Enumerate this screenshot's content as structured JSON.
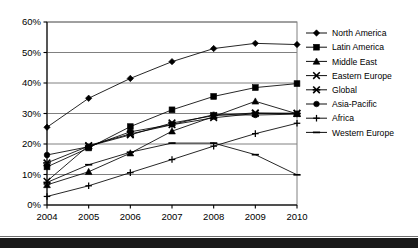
{
  "chart_data": {
    "type": "line",
    "title": "",
    "subtitle": "",
    "xlabel": "",
    "ylabel": "",
    "categories": [
      "2004",
      "2005",
      "2006",
      "2007",
      "2008",
      "2009",
      "2010"
    ],
    "x": [
      2004,
      2005,
      2006,
      2007,
      2008,
      2009,
      2010
    ],
    "ylim": [
      0,
      60
    ],
    "ytick_values": [
      0,
      10,
      20,
      30,
      40,
      50,
      60
    ],
    "ytick_labels": [
      "0%",
      "10%",
      "20%",
      "30%",
      "40%",
      "50%",
      "60%"
    ],
    "xtick_labels": [
      "2004",
      "2005",
      "2006",
      "2007",
      "2008",
      "2009",
      "2010"
    ],
    "grid": "horizontal",
    "legend_position": "right",
    "value_suffix": "%",
    "series": [
      {
        "name": "North America",
        "marker": "diamond",
        "values": [
          25.5,
          35.0,
          41.5,
          47.0,
          51.3,
          53.0,
          52.6
        ]
      },
      {
        "name": "Latin America",
        "marker": "square",
        "values": [
          12.5,
          18.7,
          25.7,
          31.2,
          35.6,
          38.5,
          39.8
        ]
      },
      {
        "name": "Middle East",
        "marker": "triangle",
        "values": [
          6.6,
          10.9,
          17.0,
          24.2,
          29.0,
          34.0,
          29.9
        ]
      },
      {
        "name": "Eastern Europe",
        "marker": "x",
        "values": [
          7.8,
          19.5,
          23.3,
          26.3,
          28.6,
          30.0,
          30.1
        ]
      },
      {
        "name": "Global",
        "marker": "star-x",
        "values": [
          13.8,
          19.3,
          23.0,
          26.9,
          29.3,
          30.2,
          30.0
        ]
      },
      {
        "name": "Asia-Pacific",
        "marker": "circle",
        "values": [
          16.4,
          19.1,
          24.0,
          26.4,
          29.6,
          29.5,
          29.8
        ]
      },
      {
        "name": "Africa",
        "marker": "plus",
        "values": [
          2.8,
          6.3,
          10.6,
          14.9,
          19.3,
          23.4,
          26.8
        ]
      },
      {
        "name": "Western Europe",
        "marker": "dash",
        "values": [
          7.4,
          13.2,
          17.3,
          20.3,
          20.3,
          16.5,
          9.9
        ]
      }
    ]
  },
  "legend": {
    "items": [
      {
        "label": "North America"
      },
      {
        "label": "Latin America"
      },
      {
        "label": "Middle East"
      },
      {
        "label": "Eastern Europe"
      },
      {
        "label": "Global"
      },
      {
        "label": "Asia-Pacific"
      },
      {
        "label": "Africa"
      },
      {
        "label": "Western Europe"
      }
    ]
  },
  "colors": {
    "series_line": "#000000",
    "grid": "#808080",
    "axis": "#000000",
    "plot_border": "#808080",
    "background": "#ffffff",
    "footer_bar": "#1a1a1a"
  }
}
